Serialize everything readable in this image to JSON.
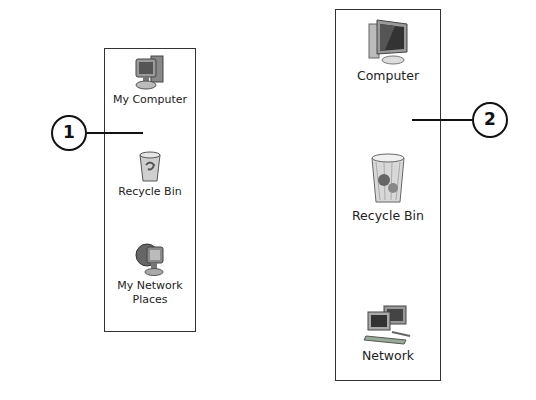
{
  "callouts": [
    {
      "number": "1"
    },
    {
      "number": "2"
    }
  ],
  "panels": [
    {
      "name": "xp-desktop-icons",
      "items": [
        {
          "icon": "computer-icon",
          "label": "My Computer"
        },
        {
          "icon": "recycle-bin-icon",
          "label": "Recycle Bin"
        },
        {
          "icon": "network-places-icon",
          "label_line1": "My Network",
          "label_line2": "Places"
        }
      ]
    },
    {
      "name": "vista-desktop-icons",
      "items": [
        {
          "icon": "computer-icon",
          "label": "Computer"
        },
        {
          "icon": "recycle-bin-icon",
          "label": "Recycle Bin"
        },
        {
          "icon": "network-icon",
          "label": "Network"
        }
      ]
    }
  ]
}
